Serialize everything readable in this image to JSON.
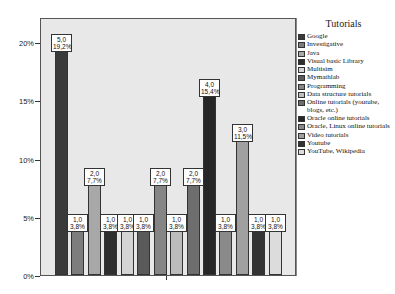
{
  "chart_data": {
    "type": "bar",
    "title": "",
    "xlabel": "",
    "ylabel": "",
    "ylim": [
      0,
      22
    ],
    "grid": false,
    "legend_position": "right",
    "legend_title": "Tutorials",
    "yticks": [
      "0%",
      "5%",
      "10%",
      "15%",
      "20%"
    ],
    "categories": [
      "Google",
      "Investigative",
      "Java",
      "Visual basic Library",
      "Multisim",
      "Mymathlab",
      "Programming",
      "Data structure tutorials",
      "Online tutorials (youtube, blogs, etc.)",
      "Oracle online tutorials",
      "Oracle, Linux online tutorials",
      "Video tutorials",
      "Youtube",
      "YouTube, Wikipedia"
    ],
    "counts": [
      5.0,
      1.0,
      2.0,
      1.0,
      1.0,
      1.0,
      2.0,
      1.0,
      2.0,
      4.0,
      1.0,
      3.0,
      1.0,
      1.0
    ],
    "values": [
      19.2,
      3.8,
      7.7,
      3.8,
      3.8,
      3.8,
      7.7,
      3.8,
      7.7,
      15.4,
      3.8,
      11.5,
      3.8,
      3.8
    ],
    "count_labels": [
      "5,0",
      "1,0",
      "2,0",
      "1,0",
      "1,0",
      "1,0",
      "2,0",
      "1,0",
      "2,0",
      "4,0",
      "1,0",
      "3,0",
      "1,0",
      "1,0"
    ],
    "pct_labels": [
      "19,2%",
      "3,8%",
      "7,7%",
      "3,8%",
      "3,8%",
      "3,8%",
      "7,7%",
      "3,8%",
      "7,7%",
      "15,4%",
      "3,8%",
      "11,5%",
      "3,8%",
      "3,8%"
    ],
    "colors": [
      "#3a3a3a",
      "#7d7d7d",
      "#a8a8a8",
      "#2e2e2e",
      "#d4d4d4",
      "#5a5a5a",
      "#858585",
      "#bcbcbc",
      "#6e6e6e",
      "#262626",
      "#8a8a8a",
      "#a0a0a0",
      "#333333",
      "#dcdcdc"
    ]
  },
  "legend": {
    "title": "Tutorials",
    "items": [
      "Google",
      "Investigative",
      "Java",
      "Visual basic Library",
      "Multisim",
      "Mymathlab",
      "Programming",
      "Data structure tutorials",
      "Online tutorials (youtube, blogs, etc.)",
      "Oracle online tutorials",
      "Oracle, Linux online tutorials",
      "Video tutorials",
      "Youtube",
      "YouTube, Wikipedia"
    ]
  }
}
